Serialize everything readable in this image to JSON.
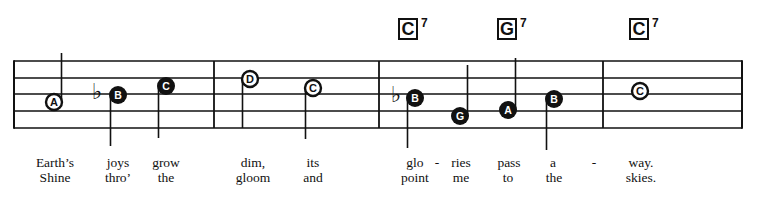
{
  "staff": {
    "left": 14,
    "right": 742,
    "lines_y": [
      61,
      78,
      94,
      111,
      128
    ],
    "barlines_x": [
      214,
      379,
      603
    ],
    "color": "#111111"
  },
  "chords": [
    {
      "root": "C",
      "quality": "7",
      "x": 398,
      "y": 18
    },
    {
      "root": "G",
      "quality": "7",
      "x": 497,
      "y": 18
    },
    {
      "root": "C",
      "quality": "7",
      "x": 629,
      "y": 18
    }
  ],
  "notes": [
    {
      "letter": "A",
      "x": 54,
      "y": 102,
      "filled": false,
      "stem": "up",
      "stem_end": 53
    },
    {
      "letter": "B",
      "x": 118,
      "y": 95,
      "filled": true,
      "stem": "down",
      "stem_end": 146,
      "flat": true,
      "flat_x": 97
    },
    {
      "letter": "C",
      "x": 166,
      "y": 86,
      "filled": true,
      "stem": "down",
      "stem_end": 138
    },
    {
      "letter": "D",
      "x": 250,
      "y": 79,
      "filled": false,
      "stem": "down",
      "stem_end": 128
    },
    {
      "letter": "C",
      "x": 313,
      "y": 88,
      "filled": false,
      "stem": "down",
      "stem_end": 139
    },
    {
      "letter": "B",
      "x": 415,
      "y": 98,
      "filled": true,
      "stem": "down",
      "stem_end": 148,
      "flat": true,
      "flat_x": 396
    },
    {
      "letter": "G",
      "x": 460,
      "y": 116,
      "filled": true,
      "stem": "up",
      "stem_end": 65
    },
    {
      "letter": "A",
      "x": 508,
      "y": 110,
      "filled": true,
      "stem": "up",
      "stem_end": 58
    },
    {
      "letter": "B",
      "x": 554,
      "y": 99,
      "filled": true,
      "stem": "down",
      "stem_end": 150
    },
    {
      "letter": "C",
      "x": 640,
      "y": 91,
      "filled": false,
      "stem": "none"
    }
  ],
  "lyrics": {
    "verse1": [
      {
        "text": "Earth’s",
        "x": 55
      },
      {
        "text": "joys",
        "x": 118
      },
      {
        "text": "grow",
        "x": 166
      },
      {
        "text": "dim,",
        "x": 253
      },
      {
        "text": "its",
        "x": 313
      },
      {
        "text": "glo",
        "x": 415
      },
      {
        "text": "-",
        "x": 437
      },
      {
        "text": "ries",
        "x": 461
      },
      {
        "text": "pass",
        "x": 509
      },
      {
        "text": "a",
        "x": 553
      },
      {
        "text": "-",
        "x": 594
      },
      {
        "text": "way.",
        "x": 641
      }
    ],
    "verse2": [
      {
        "text": "Shine",
        "x": 55
      },
      {
        "text": "thro’",
        "x": 118
      },
      {
        "text": "the",
        "x": 166
      },
      {
        "text": "gloom",
        "x": 253
      },
      {
        "text": "and",
        "x": 313
      },
      {
        "text": "point",
        "x": 415
      },
      {
        "text": "me",
        "x": 461
      },
      {
        "text": "to",
        "x": 508
      },
      {
        "text": "the",
        "x": 554
      },
      {
        "text": "skies.",
        "x": 641
      }
    ]
  }
}
